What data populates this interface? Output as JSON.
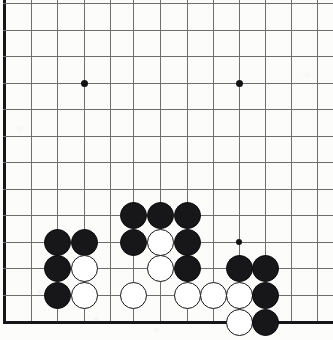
{
  "app": {
    "title": "Go board position",
    "description": "Scanned go (weiqi) board diagram, lower-left corner region"
  },
  "board": {
    "game": "go",
    "label": "go-board",
    "line_color": "#6e6e70",
    "edge_color": "#15161a",
    "background_color": "#fcfcfb",
    "black_stone_color": "#17171a",
    "white_stone_color": "#ffffff",
    "stone_diameter": 27,
    "cut_off_edges": [
      "top",
      "right"
    ],
    "visible_edges": [
      "left",
      "bottom"
    ],
    "columns_x": [
      4,
      31,
      57,
      84,
      110,
      133,
      160,
      187,
      213,
      239,
      265,
      291,
      317
    ],
    "rows_y": [
      3,
      30,
      56,
      83,
      109,
      136,
      162,
      189,
      215,
      242,
      268,
      295,
      322
    ],
    "star_points": [
      {
        "name": "star-point-upper-left",
        "x": 84,
        "y": 83,
        "size": "large"
      },
      {
        "name": "star-point-upper-right",
        "x": 239,
        "y": 83,
        "size": "large"
      },
      {
        "name": "star-point-lower-right",
        "x": 239,
        "y": 242,
        "size": "small"
      }
    ],
    "stones": [
      {
        "name": "black-stone-c9",
        "color": "black",
        "x": 133,
        "y": 215
      },
      {
        "name": "black-stone-d9",
        "color": "black",
        "x": 160,
        "y": 215
      },
      {
        "name": "black-stone-e9",
        "color": "black",
        "x": 187,
        "y": 215
      },
      {
        "name": "black-stone-a10",
        "color": "black",
        "x": 57,
        "y": 242
      },
      {
        "name": "black-stone-b10",
        "color": "black",
        "x": 84,
        "y": 242
      },
      {
        "name": "black-stone-c10",
        "color": "black",
        "x": 133,
        "y": 242
      },
      {
        "name": "white-stone-d10",
        "color": "white",
        "x": 160,
        "y": 242
      },
      {
        "name": "black-stone-e10",
        "color": "black",
        "x": 187,
        "y": 242
      },
      {
        "name": "black-stone-a11",
        "color": "black",
        "x": 57,
        "y": 268
      },
      {
        "name": "white-stone-b11",
        "color": "white",
        "x": 84,
        "y": 268
      },
      {
        "name": "white-stone-d11",
        "color": "white",
        "x": 160,
        "y": 268
      },
      {
        "name": "black-stone-e11",
        "color": "black",
        "x": 187,
        "y": 268
      },
      {
        "name": "black-stone-g11",
        "color": "black",
        "x": 239,
        "y": 268
      },
      {
        "name": "black-stone-h11",
        "color": "black",
        "x": 265,
        "y": 268
      },
      {
        "name": "black-stone-a12",
        "color": "black",
        "x": 57,
        "y": 295
      },
      {
        "name": "white-stone-b12",
        "color": "white",
        "x": 84,
        "y": 295
      },
      {
        "name": "white-stone-c12",
        "color": "white",
        "x": 133,
        "y": 295
      },
      {
        "name": "white-stone-e12",
        "color": "white",
        "x": 187,
        "y": 295
      },
      {
        "name": "white-stone-f12",
        "color": "white",
        "x": 213,
        "y": 295
      },
      {
        "name": "white-stone-g12",
        "color": "white",
        "x": 239,
        "y": 295
      },
      {
        "name": "black-stone-h12",
        "color": "black",
        "x": 265,
        "y": 295
      },
      {
        "name": "white-stone-g13",
        "color": "white",
        "x": 239,
        "y": 322
      },
      {
        "name": "black-stone-h13",
        "color": "black",
        "x": 265,
        "y": 322
      }
    ],
    "counts": {
      "black_stones": "14",
      "white_stones": "9",
      "total_stones": "23"
    }
  }
}
